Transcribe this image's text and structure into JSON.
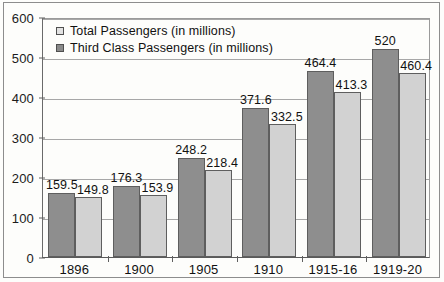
{
  "chart_data": {
    "type": "bar",
    "title": "",
    "xlabel": "",
    "ylabel": "",
    "ylim": [
      0,
      600
    ],
    "ytick_values": [
      0,
      100,
      200,
      300,
      400,
      500,
      600
    ],
    "ytick_labels": [
      "0",
      "100",
      "200",
      "300",
      "400",
      "500",
      "600"
    ],
    "grid": true,
    "legend_position": "top-left",
    "categories": [
      "1896",
      "1900",
      "1905",
      "1910",
      "1915-16",
      "1919-20"
    ],
    "series": [
      {
        "name": "Total Passengers (in millions)",
        "swatch": "light",
        "color": "#e2e2e2",
        "values": [
          159.5,
          176.3,
          248.2,
          371.6,
          464.4,
          520
        ],
        "value_labels": [
          "159.5",
          "176.3",
          "248.2",
          "371.6",
          "464.4",
          "520"
        ]
      },
      {
        "name": "Third Class Passengers (in millions)",
        "swatch": "dark",
        "color": "#8a8a8a",
        "values": [
          149.8,
          153.9,
          218.4,
          332.5,
          413.3,
          460.4
        ],
        "value_labels": [
          "149.8",
          "153.9",
          "218.4",
          "332.5",
          "413.3",
          "460.4"
        ]
      }
    ]
  },
  "legend": {
    "items": [
      {
        "label": "Total Passengers (in millions)"
      },
      {
        "label": "Third Class Passengers (in millions)"
      }
    ]
  }
}
